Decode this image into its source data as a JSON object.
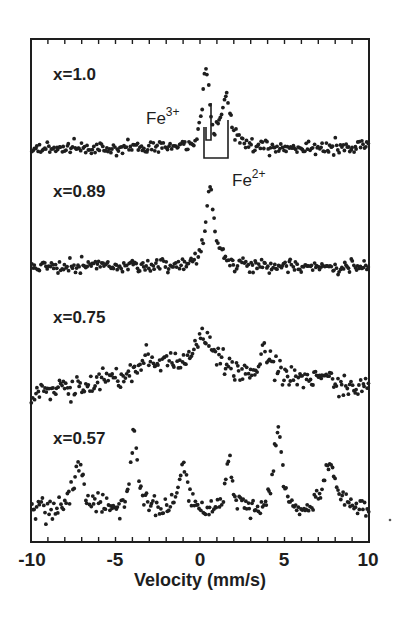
{
  "chart_data": {
    "type": "scatter",
    "title": "",
    "xlabel": "Velocity (mm/s)",
    "ylabel": "",
    "xlim": [
      -10,
      10
    ],
    "xticks": [
      -10,
      -5,
      0,
      5,
      10
    ],
    "xtick_labels": [
      "-10",
      "-5",
      "0",
      "5",
      "10"
    ],
    "minor_tick_step": 1,
    "grid": false,
    "legend": null,
    "series": [
      {
        "name": "x=1.0",
        "label": "x=1.0",
        "baseline_px": 148,
        "noise_px": 3.5,
        "peaks": [
          {
            "center": 0.35,
            "height_px": 82,
            "width": 0.45
          },
          {
            "center": 1.55,
            "height_px": 50,
            "width": 0.6
          }
        ]
      },
      {
        "name": "x=0.89",
        "label": "x=0.89",
        "baseline_px": 266,
        "noise_px": 3.5,
        "peaks": [
          {
            "center": 0.6,
            "height_px": 80,
            "width": 0.55
          }
        ]
      },
      {
        "name": "x=0.75",
        "label": "x=0.75",
        "baseline_px": 392,
        "noise_px": 6,
        "slope_profile": [
          [
            -10,
            0
          ],
          [
            -4,
            28
          ],
          [
            -3,
            42
          ],
          [
            0,
            58
          ],
          [
            1.5,
            52
          ],
          [
            2.5,
            28
          ],
          [
            3.8,
            38
          ],
          [
            5,
            28
          ],
          [
            7,
            18
          ],
          [
            10,
            0
          ]
        ],
        "peaks": [
          {
            "center": -3.3,
            "height_px": 18,
            "width": 0.6
          },
          {
            "center": 0.2,
            "height_px": 26,
            "width": 0.8
          },
          {
            "center": 3.9,
            "height_px": 22,
            "width": 0.7
          },
          {
            "center": 7.2,
            "height_px": 10,
            "width": 0.8
          }
        ]
      },
      {
        "name": "x=0.57",
        "label": "x=0.57",
        "baseline_px": 512,
        "noise_px": 5,
        "peaks": [
          {
            "center": -7.2,
            "height_px": 42,
            "width": 0.9
          },
          {
            "center": -3.9,
            "height_px": 80,
            "width": 0.45
          },
          {
            "center": -1.0,
            "height_px": 48,
            "width": 0.5
          },
          {
            "center": 1.7,
            "height_px": 48,
            "width": 0.5
          },
          {
            "center": 4.6,
            "height_px": 88,
            "width": 0.5
          },
          {
            "center": 7.7,
            "height_px": 48,
            "width": 0.9
          }
        ]
      }
    ],
    "annotations": [
      {
        "text": "Fe",
        "sup": "3+",
        "marker": "J-shaped line at ~0.65 mm/s",
        "x_px": 148,
        "y_px": 124
      },
      {
        "text": "Fe",
        "sup": "2+",
        "marker": "U-shaped bracket from ~0.2 to ~1.7 mm/s",
        "x_px": 232,
        "y_px": 178
      }
    ]
  },
  "labels": {
    "series_1": "x=1.0",
    "series_2": "x=0.89",
    "series_3": "x=0.75",
    "series_4": "x=0.57",
    "fe3_text": "Fe",
    "fe3_sup": "3+",
    "fe2_text": "Fe",
    "fe2_sup": "2+",
    "xlabel": "Velocity (mm/s)",
    "tick_m10": "-10",
    "tick_m5": "-5",
    "tick_0": "0",
    "tick_5": "5",
    "tick_10": "10"
  },
  "colors": {
    "ink": "#1e1e1e",
    "background": "#ffffff"
  }
}
